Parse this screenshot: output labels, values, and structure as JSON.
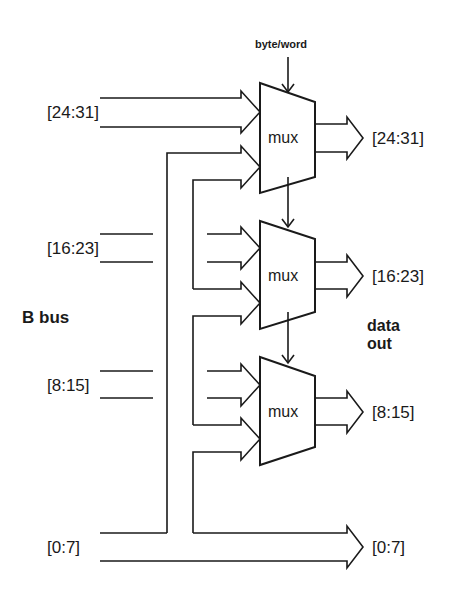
{
  "diagram": {
    "control_label": "byte/word",
    "bus_label": "B bus",
    "output_label_line1": "data",
    "output_label_line2": "out",
    "inputs": [
      {
        "label": "[24:31]"
      },
      {
        "label": "[16:23]"
      },
      {
        "label": "[8:15]"
      },
      {
        "label": "[0:7]"
      }
    ],
    "muxes": [
      {
        "label": "mux",
        "output": "[24:31]"
      },
      {
        "label": "mux",
        "output": "[16:23]"
      },
      {
        "label": "mux",
        "output": "[8:15]"
      }
    ],
    "passthrough_output": "[0:7]",
    "colors": {
      "stroke": "#1a1a1a",
      "background": "#ffffff"
    }
  }
}
